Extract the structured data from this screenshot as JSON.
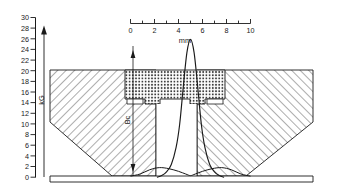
{
  "figure": {
    "name": "magnetic-lens-cross-section-with-field-plot",
    "background_color": "#ffffff",
    "line_color": "#1a1a1a"
  },
  "vertical_axis": {
    "name": "field-strength-axis",
    "unit_label": "kG",
    "min": 0,
    "max": 30,
    "tick_step": 2,
    "tick_labels": [
      "30",
      "28",
      "26",
      "24",
      "22",
      "20",
      "18",
      "16",
      "14",
      "12",
      "10",
      "8",
      "6",
      "4",
      "2",
      "0"
    ],
    "arrow_top_value": 26
  },
  "horizontal_scale": {
    "name": "distance-scale",
    "unit_label": "mm",
    "min": 0,
    "max": 10,
    "tick_step": 1,
    "labeled_ticks": [
      "0",
      "2",
      "4",
      "6",
      "8",
      "10"
    ]
  },
  "annotations": {
    "gap_dimension_label": "Bc"
  },
  "chart_data": {
    "type": "line",
    "title": "",
    "xlabel": "mm",
    "ylabel": "kG",
    "xlim": [
      0,
      10
    ],
    "ylim": [
      0,
      30
    ],
    "grid": false,
    "legend_position": "none",
    "series": [
      {
        "name": "axial-field-peak-curve",
        "comment": "sharply peaked on-axis flux density, maximum 26 kG at 5 mm",
        "x": [
          2.2,
          2.6,
          3.0,
          3.4,
          3.8,
          4.1,
          4.4,
          4.7,
          5.0,
          5.3,
          5.6,
          5.9,
          6.2,
          6.6,
          7.0,
          7.4,
          7.8
        ],
        "y": [
          0.0,
          0.3,
          1.0,
          2.4,
          5.6,
          10.0,
          17.0,
          23.4,
          25.9,
          23.4,
          17.0,
          10.0,
          5.6,
          2.4,
          1.0,
          0.3,
          0.0
        ]
      },
      {
        "name": "baseline-stray-field-curve",
        "comment": "low broad stray-field tail along the bottom of the pole structure",
        "x": [
          0.0,
          0.8,
          1.6,
          2.4,
          3.2,
          4.0,
          4.6,
          5.0,
          5.4,
          6.0,
          6.8,
          7.6,
          8.4,
          9.2,
          10.0
        ],
        "y": [
          0.2,
          0.6,
          1.4,
          1.8,
          1.6,
          1.1,
          0.6,
          0.3,
          0.6,
          1.1,
          1.6,
          1.8,
          1.4,
          0.6,
          0.2
        ]
      }
    ]
  },
  "regions": [
    {
      "name": "left-coil-winding",
      "hatch": "diagonal"
    },
    {
      "name": "right-coil-winding",
      "hatch": "diagonal"
    },
    {
      "name": "center-pole-piece",
      "hatch": "crosshatch"
    },
    {
      "name": "bore-gap",
      "hatch": "none"
    }
  ]
}
